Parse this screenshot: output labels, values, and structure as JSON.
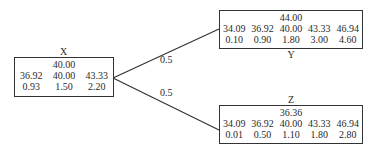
{
  "diagram": {
    "nodes": {
      "x": {
        "name": "X",
        "mean": "40.00",
        "values": [
          "36.92",
          "40.00",
          "43.33"
        ],
        "probs": [
          "0.93",
          "1.50",
          "2.20"
        ]
      },
      "y": {
        "name": "Y",
        "mean": "44.00",
        "values": [
          "34.09",
          "36.92",
          "40.00",
          "43.33",
          "46.94"
        ],
        "probs": [
          "0.10",
          "0.90",
          "1.80",
          "3.00",
          "4.60"
        ]
      },
      "z": {
        "name": "Z",
        "mean": "36.36",
        "values": [
          "34.09",
          "36.92",
          "40.00",
          "43.33",
          "46.94"
        ],
        "probs": [
          "0.01",
          "0.50",
          "1.10",
          "1.80",
          "2.80"
        ]
      }
    },
    "edges": [
      {
        "from": "X",
        "to": "Y",
        "label": "0.5"
      },
      {
        "from": "X",
        "to": "Z",
        "label": "0.5"
      }
    ]
  }
}
